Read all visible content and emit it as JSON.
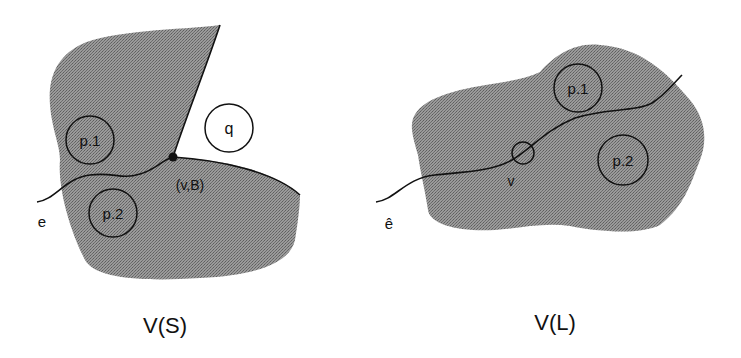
{
  "figures": [
    {
      "caption": "V(S)",
      "edge_label": "e",
      "vertex_label": "(v,B)",
      "regions": [
        {
          "label": "p.1"
        },
        {
          "label": "p.2"
        },
        {
          "label": "q"
        }
      ]
    },
    {
      "caption": "V(L)",
      "edge_label": "ê",
      "vertex_label": "v",
      "regions": [
        {
          "label": "p.1"
        },
        {
          "label": "p.2"
        }
      ]
    }
  ],
  "colors": {
    "shade": "#8c8c8c",
    "line": "#111111",
    "background": "#ffffff"
  }
}
